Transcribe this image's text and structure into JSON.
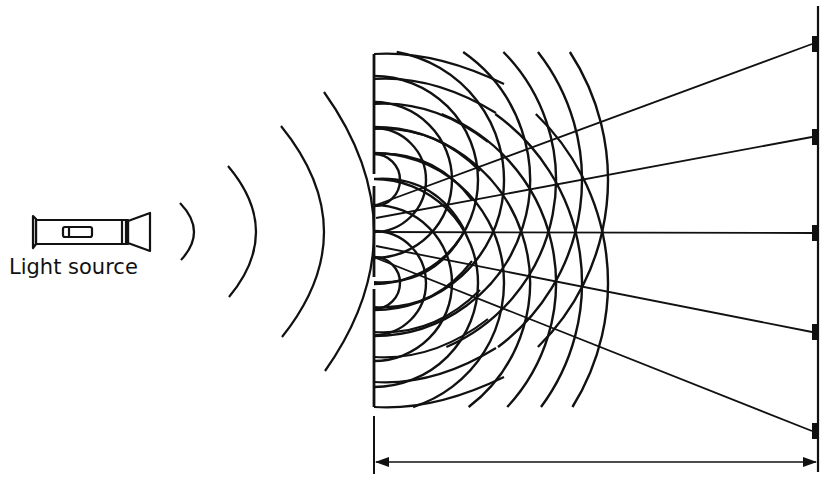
{
  "diagram": {
    "colors": {
      "ink": "#111111",
      "background": "#ffffff"
    },
    "source": {
      "label": "Light source",
      "icon": "flashlight-icon",
      "label_pos": [
        9,
        277
      ]
    },
    "incident_waves": {
      "description": "Circular wavefronts spreading from the light source toward the barrier",
      "arcs": [
        {
          "x1": 180,
          "y1": 203,
          "x2": 181,
          "y2": 260,
          "cx": 194
        },
        {
          "x1": 228,
          "y1": 166,
          "x2": 229,
          "y2": 297,
          "cx": 256
        },
        {
          "x1": 281,
          "y1": 126,
          "x2": 282,
          "y2": 337,
          "cx": 324
        },
        {
          "x1": 324,
          "y1": 92,
          "x2": 325,
          "y2": 371,
          "cx": 374
        }
      ]
    },
    "barrier": {
      "x": 374,
      "top": 54,
      "bottom": 407,
      "slits_y": [
        180,
        283
      ]
    },
    "screen": {
      "x": 818,
      "top": 6,
      "bottom": 472,
      "bright_fringes_y": [
        44,
        137,
        233,
        332,
        431
      ]
    },
    "interference": {
      "wavelength_px": 26,
      "wavefront_count": 9
    },
    "fan_lines": {
      "description": "Lines of constructive interference from the slits to bright fringes on the screen",
      "origins_y": [
        205,
        218,
        232,
        246,
        258
      ]
    },
    "distance_arrow": {
      "y": 462,
      "x_left": 374,
      "x_right": 818,
      "tick_top": 416,
      "label": ""
    }
  }
}
